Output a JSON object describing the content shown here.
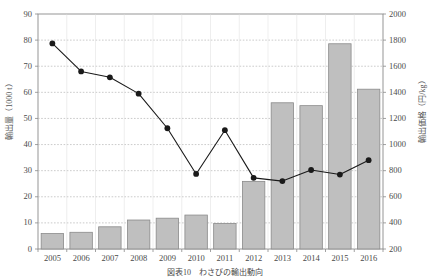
{
  "chart_data": {
    "type": "bar",
    "title": "",
    "caption": "図表10　わさびの輸出動向",
    "categories": [
      "2005",
      "2006",
      "2007",
      "2008",
      "2009",
      "2010",
      "2011",
      "2012",
      "2013",
      "2014",
      "2015",
      "2016"
    ],
    "xlabel": "",
    "grid": true,
    "legend": "none",
    "series": [
      {
        "name": "輸出量",
        "type": "bar",
        "axis": "left",
        "unit": "1000 t",
        "color": "#bfbfbf",
        "edge_color": "#8a8a8a",
        "values": [
          5.9,
          6.4,
          8.5,
          11.1,
          11.8,
          13.0,
          9.8,
          25.9,
          56.0,
          54.9,
          78.6,
          61.2
        ]
      },
      {
        "name": "輸出価格",
        "type": "line",
        "axis": "right",
        "unit": "円/kg",
        "color": "#1a1a1a",
        "marker": "circle",
        "values": [
          1775,
          1560,
          1515,
          1390,
          1125,
          775,
          1110,
          745,
          720,
          805,
          770,
          880
        ]
      }
    ],
    "left_axis": {
      "label": "輸出量（1000 t）",
      "min": 0,
      "max": 90,
      "ticks": [
        0,
        10,
        20,
        30,
        40,
        50,
        60,
        70,
        80,
        90
      ],
      "unit": "1000 t"
    },
    "right_axis": {
      "label": "輸出価格（円/kg）",
      "min": 200,
      "max": 2000,
      "ticks": [
        200,
        400,
        600,
        800,
        1000,
        1200,
        1400,
        1600,
        1800,
        2000
      ],
      "unit": "円/kg"
    }
  },
  "colors": {
    "bar_fill": "#bfbfbf",
    "bar_edge": "#8a8a8a",
    "line": "#1a1a1a",
    "grid": "#b5b5b5",
    "axis": "#8a8a8a",
    "text": "#4a4a4a",
    "background": "#ffffff"
  }
}
